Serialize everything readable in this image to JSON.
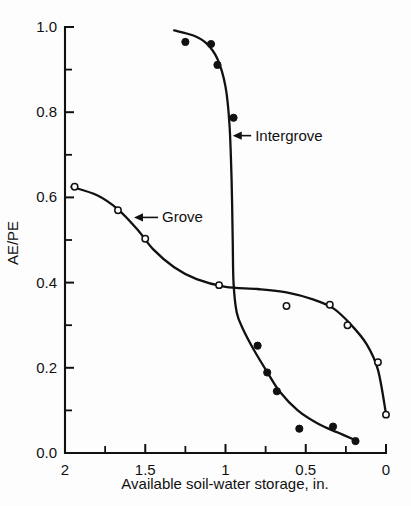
{
  "chart_data": {
    "type": "scatter",
    "title": "",
    "xlabel": "Available soil-water storage, in.",
    "ylabel": "AE/PE",
    "xlim": [
      2.0,
      0.0
    ],
    "x_axis_reversed": true,
    "ylim": [
      0.0,
      1.0
    ],
    "grid": false,
    "legend_position": "inline-annotations",
    "x_major_ticks": [
      2,
      1.5,
      1,
      0.5,
      0
    ],
    "x_major_tick_labels": [
      "2",
      "1.5",
      "1",
      "0.5",
      "0"
    ],
    "x_minor_ticks": [
      1.75,
      1.25,
      0.75,
      0.25
    ],
    "y_major_ticks": [
      0.0,
      0.2,
      0.4,
      0.6,
      0.8,
      1.0
    ],
    "y_major_tick_labels": [
      "0.0",
      "0.2",
      "0.4",
      "0.6",
      "0.8",
      "1.0"
    ],
    "y_minor_ticks": [
      0.1,
      0.3,
      0.5,
      0.7,
      0.9
    ],
    "series": [
      {
        "name": "Grove",
        "marker": "open-circle",
        "annotation": "Grove",
        "points": [
          {
            "x": 1.94,
            "y": 0.625
          },
          {
            "x": 1.67,
            "y": 0.57
          },
          {
            "x": 1.5,
            "y": 0.503
          },
          {
            "x": 1.04,
            "y": 0.394
          },
          {
            "x": 0.62,
            "y": 0.345
          },
          {
            "x": 0.35,
            "y": 0.348
          },
          {
            "x": 0.24,
            "y": 0.3
          },
          {
            "x": 0.05,
            "y": 0.213
          },
          {
            "x": 0.0,
            "y": 0.09
          }
        ],
        "curve": [
          {
            "x": 1.96,
            "y": 0.625
          },
          {
            "x": 1.8,
            "y": 0.605
          },
          {
            "x": 1.67,
            "y": 0.572
          },
          {
            "x": 1.55,
            "y": 0.525
          },
          {
            "x": 1.45,
            "y": 0.478
          },
          {
            "x": 1.32,
            "y": 0.436
          },
          {
            "x": 1.18,
            "y": 0.408
          },
          {
            "x": 1.0,
            "y": 0.39
          },
          {
            "x": 0.8,
            "y": 0.385
          },
          {
            "x": 0.62,
            "y": 0.377
          },
          {
            "x": 0.45,
            "y": 0.36
          },
          {
            "x": 0.33,
            "y": 0.34
          },
          {
            "x": 0.22,
            "y": 0.302
          },
          {
            "x": 0.12,
            "y": 0.255
          },
          {
            "x": 0.05,
            "y": 0.195
          },
          {
            "x": 0.0,
            "y": 0.092
          }
        ]
      },
      {
        "name": "Intergrove",
        "marker": "filled-circle",
        "annotation": "Intergrove",
        "points": [
          {
            "x": 1.25,
            "y": 0.965
          },
          {
            "x": 1.09,
            "y": 0.96
          },
          {
            "x": 1.05,
            "y": 0.911
          },
          {
            "x": 0.95,
            "y": 0.787
          },
          {
            "x": 0.8,
            "y": 0.252
          },
          {
            "x": 0.74,
            "y": 0.189
          },
          {
            "x": 0.68,
            "y": 0.145
          },
          {
            "x": 0.54,
            "y": 0.057
          },
          {
            "x": 0.33,
            "y": 0.062
          },
          {
            "x": 0.19,
            "y": 0.028
          }
        ],
        "curve": [
          {
            "x": 1.32,
            "y": 0.992
          },
          {
            "x": 1.2,
            "y": 0.98
          },
          {
            "x": 1.12,
            "y": 0.962
          },
          {
            "x": 1.05,
            "y": 0.925
          },
          {
            "x": 1.0,
            "y": 0.86
          },
          {
            "x": 0.975,
            "y": 0.77
          },
          {
            "x": 0.962,
            "y": 0.64
          },
          {
            "x": 0.955,
            "y": 0.5
          },
          {
            "x": 0.95,
            "y": 0.4
          },
          {
            "x": 0.93,
            "y": 0.33
          },
          {
            "x": 0.89,
            "y": 0.29
          },
          {
            "x": 0.82,
            "y": 0.24
          },
          {
            "x": 0.74,
            "y": 0.19
          },
          {
            "x": 0.66,
            "y": 0.143
          },
          {
            "x": 0.55,
            "y": 0.1
          },
          {
            "x": 0.42,
            "y": 0.068
          },
          {
            "x": 0.3,
            "y": 0.048
          },
          {
            "x": 0.19,
            "y": 0.03
          }
        ]
      }
    ],
    "annotations": [
      {
        "label": "Intergrove",
        "x": 0.84,
        "y": 0.745,
        "arrow_to_x": 0.955
      },
      {
        "label": "Grove",
        "x": 1.42,
        "y": 0.553,
        "arrow_to_x": 1.57
      }
    ]
  }
}
